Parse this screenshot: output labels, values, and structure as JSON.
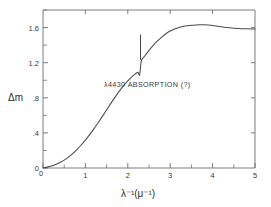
{
  "chart_data": {
    "type": "line",
    "title": "",
    "xlabel": "λ⁻¹(μ⁻¹)",
    "ylabel": "Δm",
    "xlim": [
      0,
      5
    ],
    "ylim": [
      0,
      1.8
    ],
    "grid": false,
    "legend": "none",
    "x_ticks_major": [
      0,
      1,
      2,
      3,
      4,
      5
    ],
    "x_tick_labels": [
      "0",
      "1",
      "2",
      "3",
      "4",
      "5"
    ],
    "x_ticks_minor": [
      0.5,
      1.5,
      2.5,
      3.5,
      4.5
    ],
    "y_ticks_major": [
      0,
      0.4,
      0.8,
      1.2,
      1.6
    ],
    "y_tick_labels": [
      "0",
      ".4",
      ".8",
      "1.2",
      "1.6"
    ],
    "y_ticks_minor": [
      0.2,
      0.6,
      1.0,
      1.4,
      1.8
    ],
    "annotations": [
      {
        "text": "λ4430 ABSORPTION (?)",
        "x": 2.45,
        "y": 0.93
      }
    ],
    "series": [
      {
        "name": "interstellar extinction curve",
        "x": [
          0.0,
          0.1,
          0.2,
          0.3,
          0.4,
          0.5,
          0.6,
          0.7,
          0.8,
          0.9,
          1.0,
          1.1,
          1.2,
          1.3,
          1.4,
          1.5,
          1.6,
          1.7,
          1.8,
          1.9,
          2.0,
          2.1,
          2.18,
          2.24,
          2.28,
          2.32,
          2.4,
          2.5,
          2.6,
          2.7,
          2.8,
          2.9,
          3.0,
          3.1,
          3.2,
          3.3,
          3.4,
          3.5,
          3.6,
          3.7,
          3.8,
          3.9,
          4.0,
          4.2,
          4.4,
          4.6,
          4.8,
          5.0
        ],
        "y": [
          0.0,
          0.01,
          0.023,
          0.04,
          0.062,
          0.09,
          0.124,
          0.164,
          0.21,
          0.262,
          0.318,
          0.38,
          0.446,
          0.516,
          0.588,
          0.662,
          0.736,
          0.808,
          0.876,
          0.938,
          0.993,
          1.04,
          1.072,
          1.09,
          1.062,
          1.222,
          1.276,
          1.34,
          1.398,
          1.448,
          1.492,
          1.53,
          1.56,
          1.584,
          1.6,
          1.612,
          1.62,
          1.626,
          1.63,
          1.632,
          1.633,
          1.63,
          1.624,
          1.61,
          1.598,
          1.59,
          1.586,
          1.584
        ]
      },
      {
        "name": "lambda-4430 absorption spike",
        "x": [
          2.3,
          2.3
        ],
        "y": [
          1.232,
          1.52
        ]
      }
    ],
    "spike": {
      "position_x": 2.3,
      "base_y": 1.232,
      "peak_y": 1.52,
      "label": "λ4430 ABSORPTION (?)"
    },
    "notch": {
      "position_x": 2.25,
      "depth_y": 1.062,
      "shoulder_y": 1.09
    }
  }
}
